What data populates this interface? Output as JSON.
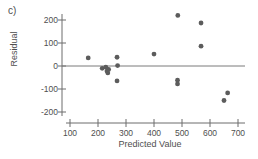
{
  "figure": {
    "panel_label": "c)",
    "background_color": "#ffffff",
    "axis_color": "#6d6d6d",
    "point_color": "#5c5c5c"
  },
  "chart_data": {
    "type": "scatter",
    "title": "",
    "panel": "c)",
    "xlabel": "Predicted Value",
    "ylabel": "Residual",
    "xlim": [
      100,
      700
    ],
    "ylim": [
      -200,
      220
    ],
    "xticks": [
      100,
      200,
      300,
      400,
      500,
      600,
      700
    ],
    "xtick_labels": [
      "100",
      "200",
      "300",
      "400",
      "500",
      "600",
      "700"
    ],
    "yticks": [
      200,
      100,
      0,
      -100,
      -200
    ],
    "ytick_labels": [
      "200",
      "100",
      "0",
      "-100",
      "-200"
    ],
    "grid": false,
    "legend": false,
    "reference_lines": [
      {
        "name": "zero-residual-line",
        "orientation": "horizontal",
        "y": 0
      }
    ],
    "points": [
      {
        "x": 165,
        "y": 35
      },
      {
        "x": 215,
        "y": -10
      },
      {
        "x": 228,
        "y": -5
      },
      {
        "x": 232,
        "y": -22
      },
      {
        "x": 235,
        "y": -30
      },
      {
        "x": 238,
        "y": -15
      },
      {
        "x": 268,
        "y": 38
      },
      {
        "x": 270,
        "y": 2
      },
      {
        "x": 268,
        "y": -65
      },
      {
        "x": 400,
        "y": 52
      },
      {
        "x": 485,
        "y": 220
      },
      {
        "x": 484,
        "y": -62
      },
      {
        "x": 484,
        "y": -78
      },
      {
        "x": 568,
        "y": 187
      },
      {
        "x": 568,
        "y": 86
      },
      {
        "x": 650,
        "y": -150
      },
      {
        "x": 663,
        "y": -117
      }
    ]
  }
}
